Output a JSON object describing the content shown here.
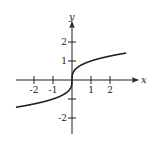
{
  "chart_data": {
    "type": "line",
    "title": "",
    "function": "y = x^(1/3)",
    "xlabel": "x",
    "ylabel": "y",
    "xlim": [
      -2.95,
      2.85
    ],
    "ylim": [
      -2.7,
      2.9
    ],
    "x_ticks": [
      -2,
      -1,
      1,
      2
    ],
    "x_tick_labels": [
      "-2",
      "-1",
      "1",
      "2"
    ],
    "y_ticks": [
      2,
      1,
      -1,
      -2
    ],
    "y_tick_labels": [
      "2",
      "1",
      "",
      "-2"
    ],
    "grid": false,
    "legend": null,
    "series": [
      {
        "name": "cube-root curve",
        "x": [
          -2.95,
          -2.5,
          -2,
          -1.5,
          -1,
          -0.5,
          -0.2,
          -0.05,
          0,
          0.05,
          0.2,
          0.5,
          1,
          1.5,
          2,
          2.5,
          2.85
        ],
        "y": [
          -1.43,
          -1.36,
          -1.26,
          -1.14,
          -1.0,
          -0.79,
          -0.58,
          -0.37,
          0,
          0.37,
          0.58,
          0.79,
          1.0,
          1.14,
          1.26,
          1.36,
          1.42
        ]
      }
    ],
    "colors": {
      "curve": "#222222",
      "axes": "#222222"
    }
  }
}
